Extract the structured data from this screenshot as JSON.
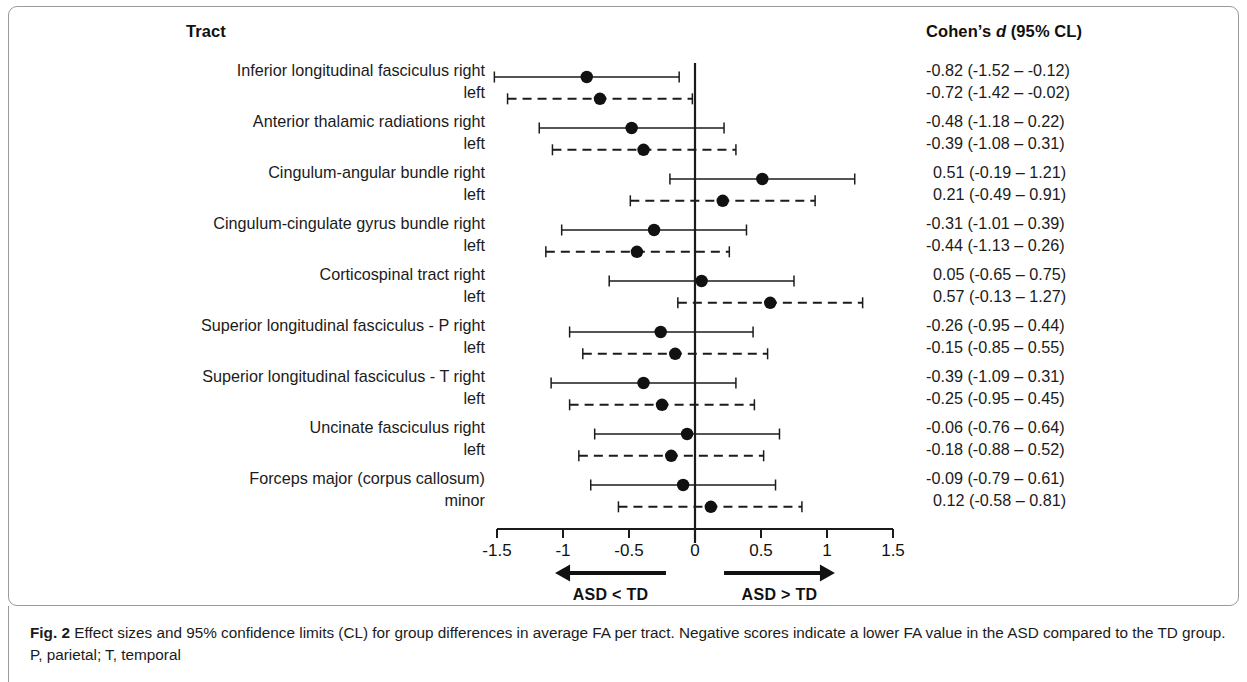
{
  "figure": {
    "tract_header": "Tract",
    "cohen_header_pre": "Cohen’s ",
    "cohen_header_ital": "d",
    "cohen_header_post": " (95% CL)",
    "caption_label": "Fig. 2",
    "caption_text": " Effect sizes and 95% confidence limits (CL) for group differences in average FA per tract. Negative scores indicate a lower FA value in the ASD compared to the TD group. P, parietal; T, temporal"
  },
  "axis": {
    "ticks": [
      "-1.5",
      "-1",
      "-0.5",
      "0",
      "0.5",
      "1",
      "1.5"
    ],
    "tick_values": [
      -1.5,
      -1,
      -0.5,
      0,
      0.5,
      1,
      1.5
    ],
    "xmin": -1.5,
    "xmax": 1.5,
    "reference_line": 0
  },
  "annotations": {
    "left_arrow_label": "ASD < TD",
    "right_arrow_label": "ASD  > TD"
  },
  "colors": {
    "marker": "#111111",
    "line": "#1b1b1b",
    "panel_border": "#9a9a9a",
    "text": "#1b1b1b"
  },
  "chart_data": {
    "type": "forest",
    "title": "Effect sizes and 95% confidence limits (CL) for group differences in average FA per tract",
    "xlabel": "Cohen’s d",
    "ylabel": "Tract",
    "xlim": [
      -1.5,
      1.5
    ],
    "grid": false,
    "legend": null,
    "reference_line": 0,
    "rows": [
      {
        "label": "Inferior longitudinal fasciculus right",
        "side": "right",
        "style": "solid",
        "d": -0.82,
        "lo": -1.52,
        "hi": -0.12,
        "text": "-0.82 (-1.52 – -0.12)"
      },
      {
        "label": "left",
        "side": "left",
        "style": "dashed",
        "d": -0.72,
        "lo": -1.42,
        "hi": -0.02,
        "text": "-0.72 (-1.42 – -0.02)"
      },
      {
        "label": "Anterior thalamic radiations right",
        "side": "right",
        "style": "solid",
        "d": -0.48,
        "lo": -1.18,
        "hi": 0.22,
        "text": "-0.48 (-1.18 – 0.22)"
      },
      {
        "label": "left",
        "side": "left",
        "style": "dashed",
        "d": -0.39,
        "lo": -1.08,
        "hi": 0.31,
        "text": "-0.39 (-1.08 – 0.31)"
      },
      {
        "label": "Cingulum-angular bundle right",
        "side": "right",
        "style": "solid",
        "d": 0.51,
        "lo": -0.19,
        "hi": 1.21,
        "text": "0.51 (-0.19 – 1.21)"
      },
      {
        "label": "left",
        "side": "left",
        "style": "dashed",
        "d": 0.21,
        "lo": -0.49,
        "hi": 0.91,
        "text": "0.21 (-0.49 – 0.91)"
      },
      {
        "label": "Cingulum-cingulate gyrus bundle right",
        "side": "right",
        "style": "solid",
        "d": -0.31,
        "lo": -1.01,
        "hi": 0.39,
        "text": "-0.31 (-1.01 – 0.39)"
      },
      {
        "label": "left",
        "side": "left",
        "style": "dashed",
        "d": -0.44,
        "lo": -1.13,
        "hi": 0.26,
        "text": "-0.44 (-1.13 – 0.26)"
      },
      {
        "label": "Corticospinal tract right",
        "side": "right",
        "style": "solid",
        "d": 0.05,
        "lo": -0.65,
        "hi": 0.75,
        "text": "0.05 (-0.65 – 0.75)"
      },
      {
        "label": "left",
        "side": "left",
        "style": "dashed",
        "d": 0.57,
        "lo": -0.13,
        "hi": 1.27,
        "text": "0.57 (-0.13 – 1.27)"
      },
      {
        "label": "Superior longitudinal fasciculus - P right",
        "side": "right",
        "style": "solid",
        "d": -0.26,
        "lo": -0.95,
        "hi": 0.44,
        "text": "-0.26 (-0.95 – 0.44)"
      },
      {
        "label": "left",
        "side": "left",
        "style": "dashed",
        "d": -0.15,
        "lo": -0.85,
        "hi": 0.55,
        "text": "-0.15 (-0.85 – 0.55)"
      },
      {
        "label": "Superior longitudinal fasciculus - T right",
        "side": "right",
        "style": "solid",
        "d": -0.39,
        "lo": -1.09,
        "hi": 0.31,
        "text": "-0.39 (-1.09 – 0.31)"
      },
      {
        "label": "left",
        "side": "left",
        "style": "dashed",
        "d": -0.25,
        "lo": -0.95,
        "hi": 0.45,
        "text": "-0.25 (-0.95 – 0.45)"
      },
      {
        "label": "Uncinate fasciculus right",
        "side": "right",
        "style": "solid",
        "d": -0.06,
        "lo": -0.76,
        "hi": 0.64,
        "text": "-0.06 (-0.76 – 0.64)"
      },
      {
        "label": "left",
        "side": "left",
        "style": "dashed",
        "d": -0.18,
        "lo": -0.88,
        "hi": 0.52,
        "text": "-0.18 (-0.88 – 0.52)"
      },
      {
        "label": "Forceps major (corpus callosum)",
        "side": "right",
        "style": "solid",
        "d": -0.09,
        "lo": -0.79,
        "hi": 0.61,
        "text": "-0.09 (-0.79 – 0.61)"
      },
      {
        "label": "minor",
        "side": "left",
        "style": "dashed",
        "d": 0.12,
        "lo": -0.58,
        "hi": 0.81,
        "text": "0.12 (-0.58 – 0.81)"
      }
    ]
  }
}
